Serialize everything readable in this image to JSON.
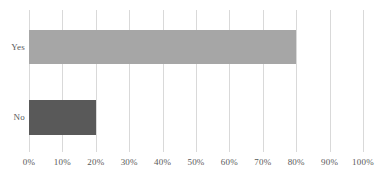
{
  "chart_data": {
    "type": "bar",
    "orientation": "horizontal",
    "title": "",
    "subtitle": "",
    "xlabel": "",
    "ylabel": "",
    "categories": [
      "Yes",
      "No"
    ],
    "values": [
      80,
      20
    ],
    "value_unit": "%",
    "xlim": [
      0,
      100
    ],
    "xticks": [
      0,
      10,
      20,
      30,
      40,
      50,
      60,
      70,
      80,
      90,
      100
    ],
    "xtick_labels": [
      "0%",
      "10%",
      "20%",
      "30%",
      "40%",
      "50%",
      "60%",
      "70%",
      "80%",
      "90%",
      "100%"
    ],
    "bar_colors": [
      "#a6a6a6",
      "#595959"
    ],
    "grid": {
      "vertical": true,
      "horizontal": false,
      "color": "#d9d9d9"
    },
    "legend": {
      "visible": false,
      "position": "none",
      "entries": []
    },
    "axis_label_color": "#595959",
    "background_color": "#ffffff",
    "data_labels_visible": false,
    "series": [
      {
        "name": "Share of respondents",
        "values": [
          80,
          20
        ]
      }
    ]
  }
}
